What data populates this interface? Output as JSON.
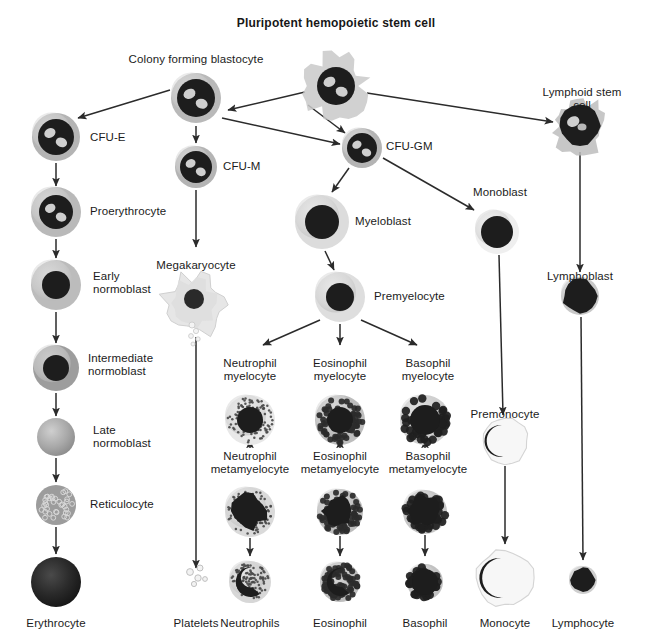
{
  "figure": {
    "title": "Pluripotent hemopoietic stem cell",
    "type": "hematopoiesis-lineage-diagram",
    "background_color": "#ffffff",
    "text_color": "#1b1b1b",
    "arrow_color": "#2b2b2b"
  },
  "cells": [
    {
      "id": "pluripotent-stem-cell",
      "label": "Pluripotent hemopoietic stem cell",
      "label_pos": "top",
      "x": 336,
      "y": 86,
      "r": 27,
      "style": "ragged-blast",
      "cyto": "#c9c9c9",
      "nucleus": "#1d1d1d",
      "nucleus_r": 19,
      "vacuoles": 2
    },
    {
      "id": "colony-forming-blastocyte",
      "label": "Colony forming blastocyte",
      "label_pos": "top",
      "x": 196,
      "y": 98,
      "r": 25,
      "style": "blast",
      "cyto": "#b9b9b9",
      "nucleus": "#1d1d1d",
      "nucleus_r": 19,
      "vacuoles": 2
    },
    {
      "id": "lymphoid-stem-cell",
      "label": "Lymphoid stem cell",
      "label_pos": "top",
      "x": 580,
      "y": 126,
      "r": 24,
      "style": "ragged-dark",
      "cyto": "#bdbdbd",
      "nucleus": "#1d1d1d",
      "nucleus_r": 20,
      "vacuoles": 1
    },
    {
      "id": "cfu-e",
      "label": "CFU-E",
      "label_pos": "right",
      "x": 56,
      "y": 137,
      "r": 24,
      "style": "blast",
      "cyto": "#b4b4b4",
      "nucleus": "#1d1d1d",
      "nucleus_r": 18,
      "vacuoles": 2
    },
    {
      "id": "cfu-m",
      "label": "CFU-M",
      "label_pos": "right",
      "x": 196,
      "y": 167,
      "r": 21,
      "style": "blast",
      "cyto": "#b4b4b4",
      "nucleus": "#1d1d1d",
      "nucleus_r": 16,
      "vacuoles": 2
    },
    {
      "id": "cfu-gm",
      "label": "CFU-GM",
      "label_pos": "right",
      "x": 362,
      "y": 148,
      "r": 20,
      "style": "blast",
      "cyto": "#b4b4b4",
      "nucleus": "#1d1d1d",
      "nucleus_r": 15,
      "vacuoles": 2
    },
    {
      "id": "proerythrocyte",
      "label": "Proerythrocyte",
      "label_pos": "right",
      "x": 56,
      "y": 212,
      "r": 25,
      "style": "blast",
      "cyto": "#b9b9b9",
      "nucleus": "#1d1d1d",
      "nucleus_r": 17,
      "vacuoles": 2
    },
    {
      "id": "myeloblast",
      "label": "Myeloblast",
      "label_pos": "right",
      "x": 322,
      "y": 222,
      "r": 27,
      "style": "pale-blast",
      "cyto": "#dcdcdc",
      "nucleus": "#1d1d1d",
      "nucleus_r": 17,
      "vacuoles": 0
    },
    {
      "id": "monoblast",
      "label": "Monoblast",
      "label_pos": "top",
      "x": 497,
      "y": 232,
      "r": 22,
      "style": "pale-blast",
      "cyto": "#efefef",
      "nucleus": "#1d1d1d",
      "nucleus_r": 16,
      "vacuoles": 0
    },
    {
      "id": "early-normoblast",
      "label": "Early\nnormoblast",
      "label_pos": "right",
      "x": 56,
      "y": 285,
      "r": 25,
      "style": "normoblast",
      "cyto": "#bcbcbc",
      "nucleus": "#1d1d1d",
      "nucleus_r": 14,
      "vacuoles": 0
    },
    {
      "id": "megakaryocyte",
      "label": "Megakaryocyte",
      "label_pos": "top",
      "x": 196,
      "y": 305,
      "r": 30,
      "style": "megakaryocyte",
      "cyto": "#e2e2e2",
      "nucleus": "#2a2a2a",
      "nucleus_r": 10,
      "vacuoles": 0
    },
    {
      "id": "premyelocyte",
      "label": "Premyelocyte",
      "label_pos": "right",
      "x": 340,
      "y": 297,
      "r": 25,
      "style": "pale-blast",
      "cyto": "#dedede",
      "nucleus": "#1d1d1d",
      "nucleus_r": 14,
      "vacuoles": 0
    },
    {
      "id": "lymphoblast",
      "label": "Lymphoblast",
      "label_pos": "top",
      "x": 580,
      "y": 296,
      "r": 19,
      "style": "dark-round",
      "cyto": "#c8c8c8",
      "nucleus": "#1d1d1d",
      "nucleus_r": 17,
      "vacuoles": 0
    },
    {
      "id": "intermediate-normoblast",
      "label": "Intermediate\nnormoblast",
      "label_pos": "right",
      "x": 56,
      "y": 368,
      "r": 23,
      "style": "normoblast",
      "cyto": "#9d9d9d",
      "nucleus": "#1d1d1d",
      "nucleus_r": 13,
      "vacuoles": 0
    },
    {
      "id": "neutrophil-myelocyte",
      "label": "Neutrophil\nmyelocyte",
      "label_pos": "top",
      "x": 250,
      "y": 420,
      "r": 25,
      "style": "granular-fine",
      "cyto": "#e8e8e8",
      "nucleus": "#1d1d1d",
      "nucleus_r": 13,
      "vacuoles": 0
    },
    {
      "id": "eosinophil-myelocyte",
      "label": "Eosinophil\nmyelocyte",
      "label_pos": "top",
      "x": 340,
      "y": 420,
      "r": 25,
      "style": "granular-coarse",
      "cyto": "#bdbdbd",
      "nucleus": "#1d1d1d",
      "nucleus_r": 13,
      "vacuoles": 0
    },
    {
      "id": "basophil-myelocyte",
      "label": "Basophil\nmyelocyte",
      "label_pos": "top",
      "x": 425,
      "y": 420,
      "r": 25,
      "style": "granular-blob",
      "cyto": "#d0d0d0",
      "nucleus": "#1d1d1d",
      "nucleus_r": 15,
      "vacuoles": 0
    },
    {
      "id": "late-normoblast",
      "label": "Late\nnormoblast",
      "label_pos": "right",
      "x": 56,
      "y": 437,
      "r": 19,
      "style": "plain",
      "cyto": "#a9a9a9",
      "nucleus": "#a9a9a9",
      "nucleus_r": 0,
      "vacuoles": 0
    },
    {
      "id": "premonocyte",
      "label": "Premonocyte",
      "label_pos": "top",
      "x": 505,
      "y": 441,
      "r": 23,
      "style": "kidney",
      "cyto": "#f2f2f2",
      "nucleus": "#1d1d1d",
      "nucleus_r": 16,
      "vacuoles": 0
    },
    {
      "id": "neutrophil-metamyelocyte",
      "label": "Neutrophil\nmetamyelocyte",
      "label_pos": "top",
      "x": 250,
      "y": 512,
      "r": 25,
      "style": "granular-fine-band",
      "cyto": "#dadada",
      "nucleus": "#1d1d1d",
      "nucleus_r": 17,
      "vacuoles": 0
    },
    {
      "id": "eosinophil-metamyelocyte",
      "label": "Eosinophil\nmetamyelocyte",
      "label_pos": "top",
      "x": 340,
      "y": 512,
      "r": 23,
      "style": "granular-coarse-band",
      "cyto": "#bdbdbd",
      "nucleus": "#1d1d1d",
      "nucleus_r": 15,
      "vacuoles": 0
    },
    {
      "id": "basophil-metamyelocyte",
      "label": "Basophil\nmetamyelocyte",
      "label_pos": "top",
      "x": 425,
      "y": 512,
      "r": 22,
      "style": "granular-blob-band",
      "cyto": "#c6c6c6",
      "nucleus": "#1d1d1d",
      "nucleus_r": 15,
      "vacuoles": 0
    },
    {
      "id": "reticulocyte",
      "label": "Reticulocyte",
      "label_pos": "right",
      "x": 56,
      "y": 505,
      "r": 20,
      "style": "reticulated",
      "cyto": "#9f9f9f",
      "nucleus": "#9f9f9f",
      "nucleus_r": 0,
      "vacuoles": 0
    },
    {
      "id": "erythrocyte",
      "label": "Erythrocyte",
      "label_pos": "bottom",
      "x": 56,
      "y": 582,
      "r": 25,
      "style": "erythrocyte",
      "cyto": "#262626",
      "nucleus": "#111111",
      "nucleus_r": 18,
      "vacuoles": 0
    },
    {
      "id": "platelets",
      "label": "Platelets",
      "label_pos": "bottom",
      "x": 196,
      "y": 582,
      "r": 9,
      "style": "platelets",
      "cyto": "#e4e4e4",
      "nucleus": "#e4e4e4",
      "nucleus_r": 0,
      "vacuoles": 0
    },
    {
      "id": "neutrophils",
      "label": "Neutrophils",
      "label_pos": "bottom",
      "x": 250,
      "y": 582,
      "r": 21,
      "style": "segmented-fine",
      "cyto": "#d7d7d7",
      "nucleus": "#1d1d1d",
      "nucleus_r": 15,
      "vacuoles": 0
    },
    {
      "id": "eosinophil",
      "label": "Eosinophil",
      "label_pos": "bottom",
      "x": 340,
      "y": 582,
      "r": 20,
      "style": "segmented-coarse",
      "cyto": "#bebebe",
      "nucleus": "#1d1d1d",
      "nucleus_r": 14,
      "vacuoles": 0
    },
    {
      "id": "basophil",
      "label": "Basophil",
      "label_pos": "bottom",
      "x": 425,
      "y": 582,
      "r": 18,
      "style": "granular-blob-dense",
      "cyto": "#c2c2c2",
      "nucleus": "#1d1d1d",
      "nucleus_r": 13,
      "vacuoles": 0
    },
    {
      "id": "monocyte",
      "label": "Monocyte",
      "label_pos": "bottom",
      "x": 505,
      "y": 578,
      "r": 28,
      "style": "kidney-large",
      "cyto": "#f5f5f5",
      "nucleus": "#1d1d1d",
      "nucleus_r": 20,
      "vacuoles": 0
    },
    {
      "id": "lymphocyte",
      "label": "Lymphocyte",
      "label_pos": "bottom",
      "x": 583,
      "y": 580,
      "r": 14,
      "style": "dark-round",
      "cyto": "#cfcfcf",
      "nucleus": "#1d1d1d",
      "nucleus_r": 12,
      "vacuoles": 0
    }
  ],
  "labels": [
    {
      "id": "label-pluripotent",
      "text": "Pluripotent hemopoietic stem cell",
      "x": 336,
      "y": 16,
      "align": "c",
      "bold": true
    },
    {
      "id": "label-colony-forming-blastocyte",
      "text": "Colony forming blastocyte",
      "x": 196,
      "y": 53,
      "align": "c",
      "bold": false
    },
    {
      "id": "label-lymphoid-stem-cell",
      "text": "Lymphoid stem cell",
      "x": 582,
      "y": 86,
      "align": "c",
      "bold": false
    },
    {
      "id": "label-cfu-e",
      "text": "CFU-E",
      "x": 90,
      "y": 131,
      "align": "l",
      "bold": false
    },
    {
      "id": "label-cfu-m",
      "text": "CFU-M",
      "x": 223,
      "y": 160,
      "align": "l",
      "bold": false
    },
    {
      "id": "label-cfu-gm",
      "text": "CFU-GM",
      "x": 386,
      "y": 140,
      "align": "l",
      "bold": false
    },
    {
      "id": "label-proerythrocyte",
      "text": "Proerythrocyte",
      "x": 90,
      "y": 205,
      "align": "l",
      "bold": false
    },
    {
      "id": "label-myeloblast",
      "text": "Myeloblast",
      "x": 355,
      "y": 215,
      "align": "l",
      "bold": false
    },
    {
      "id": "label-monoblast",
      "text": "Monoblast",
      "x": 473,
      "y": 186,
      "align": "l",
      "bold": false
    },
    {
      "id": "label-early-normoblast",
      "text": "Early\nnormoblast",
      "x": 93,
      "y": 270,
      "align": "l",
      "bold": false
    },
    {
      "id": "label-megakaryocyte",
      "text": "Megakaryocyte",
      "x": 196,
      "y": 259,
      "align": "c",
      "bold": false
    },
    {
      "id": "label-premyelocyte",
      "text": "Premyelocyte",
      "x": 374,
      "y": 290,
      "align": "l",
      "bold": false
    },
    {
      "id": "label-lymphoblast",
      "text": "Lymphoblast",
      "x": 580,
      "y": 270,
      "align": "c",
      "bold": false
    },
    {
      "id": "label-intermediate-normoblast",
      "text": "Intermediate\nnormoblast",
      "x": 88,
      "y": 352,
      "align": "l",
      "bold": false
    },
    {
      "id": "label-neutrophil-myelocyte",
      "text": "Neutrophil\nmyelocyte",
      "x": 250,
      "y": 357,
      "align": "c",
      "bold": false
    },
    {
      "id": "label-eosinophil-myelocyte",
      "text": "Eosinophil\nmyelocyte",
      "x": 340,
      "y": 357,
      "align": "c",
      "bold": false
    },
    {
      "id": "label-basophil-myelocyte",
      "text": "Basophil\nmyelocyte",
      "x": 428,
      "y": 357,
      "align": "c",
      "bold": false
    },
    {
      "id": "label-late-normoblast",
      "text": "Late\nnormoblast",
      "x": 93,
      "y": 424,
      "align": "l",
      "bold": false
    },
    {
      "id": "label-premonocyte",
      "text": "Premonocyte",
      "x": 505,
      "y": 408,
      "align": "c",
      "bold": false
    },
    {
      "id": "label-neutrophil-metamyelocyte",
      "text": "Neutrophil\nmetamyelocyte",
      "x": 250,
      "y": 450,
      "align": "c",
      "bold": false
    },
    {
      "id": "label-eosinophil-metamyelocyte",
      "text": "Eosinophil\nmetamyelocyte",
      "x": 340,
      "y": 450,
      "align": "c",
      "bold": false
    },
    {
      "id": "label-basophil-metamyelocyte",
      "text": "Basophil\nmetamyelocyte",
      "x": 428,
      "y": 450,
      "align": "c",
      "bold": false
    },
    {
      "id": "label-reticulocyte",
      "text": "Reticulocyte",
      "x": 90,
      "y": 498,
      "align": "l",
      "bold": false
    },
    {
      "id": "label-erythrocyte",
      "text": "Erythrocyte",
      "x": 56,
      "y": 617,
      "align": "c",
      "bold": false
    },
    {
      "id": "label-platelets",
      "text": "Platelets",
      "x": 196,
      "y": 617,
      "align": "c",
      "bold": false
    },
    {
      "id": "label-neutrophils",
      "text": "Neutrophils",
      "x": 250,
      "y": 617,
      "align": "c",
      "bold": false
    },
    {
      "id": "label-eosinophil",
      "text": "Eosinophil",
      "x": 340,
      "y": 617,
      "align": "c",
      "bold": false
    },
    {
      "id": "label-basophil",
      "text": "Basophil",
      "x": 425,
      "y": 617,
      "align": "c",
      "bold": false
    },
    {
      "id": "label-monocyte",
      "text": "Monocyte",
      "x": 505,
      "y": 617,
      "align": "c",
      "bold": false
    },
    {
      "id": "label-lymphocyte",
      "text": "Lymphocyte",
      "x": 583,
      "y": 617,
      "align": "c",
      "bold": false
    }
  ],
  "arrows": [
    {
      "id": "arrow-stem-to-blastocyte",
      "from": "pluripotent-stem-cell",
      "to": "colony-forming-blastocyte",
      "x1": 305,
      "y1": 92,
      "x2": 228,
      "y2": 110
    },
    {
      "id": "arrow-stem-to-cfu-gm",
      "from": "pluripotent-stem-cell",
      "to": "cfu-gm",
      "x1": 308,
      "y1": 105,
      "x2": 345,
      "y2": 133
    },
    {
      "id": "arrow-stem-to-lymphoid",
      "from": "pluripotent-stem-cell",
      "to": "lymphoid-stem-cell",
      "x1": 367,
      "y1": 93,
      "x2": 553,
      "y2": 122
    },
    {
      "id": "arrow-blastocyte-to-cfu-e",
      "from": "colony-forming-blastocyte",
      "to": "cfu-e",
      "x1": 170,
      "y1": 90,
      "x2": 78,
      "y2": 118
    },
    {
      "id": "arrow-blastocyte-to-cfu-m",
      "from": "colony-forming-blastocyte",
      "to": "cfu-m",
      "x1": 196,
      "y1": 126,
      "x2": 196,
      "y2": 143
    },
    {
      "id": "arrow-blastocyte-to-cfu-gm",
      "from": "colony-forming-blastocyte",
      "to": "cfu-gm",
      "x1": 222,
      "y1": 118,
      "x2": 340,
      "y2": 144
    },
    {
      "id": "arrow-cfu-e-to-proerythrocyte",
      "from": "cfu-e",
      "to": "proerythrocyte",
      "x1": 56,
      "y1": 163,
      "x2": 56,
      "y2": 186
    },
    {
      "id": "arrow-proerythrocyte-to-early",
      "from": "proerythrocyte",
      "to": "early-normoblast",
      "x1": 56,
      "y1": 239,
      "x2": 56,
      "y2": 258
    },
    {
      "id": "arrow-early-to-intermediate",
      "from": "early-normoblast",
      "to": "intermediate-normoblast",
      "x1": 56,
      "y1": 312,
      "x2": 56,
      "y2": 343
    },
    {
      "id": "arrow-intermediate-to-late",
      "from": "intermediate-normoblast",
      "to": "late-normoblast",
      "x1": 56,
      "y1": 393,
      "x2": 56,
      "y2": 416
    },
    {
      "id": "arrow-late-to-reticulocyte",
      "from": "late-normoblast",
      "to": "reticulocyte",
      "x1": 56,
      "y1": 458,
      "x2": 56,
      "y2": 482
    },
    {
      "id": "arrow-reticulocyte-to-erythrocyte",
      "from": "reticulocyte",
      "to": "erythrocyte",
      "x1": 56,
      "y1": 527,
      "x2": 56,
      "y2": 554
    },
    {
      "id": "arrow-cfu-m-to-megakaryocyte",
      "from": "cfu-m",
      "to": "megakaryocyte",
      "x1": 196,
      "y1": 190,
      "x2": 196,
      "y2": 247
    },
    {
      "id": "arrow-megakaryocyte-to-platelets",
      "from": "megakaryocyte",
      "to": "platelets",
      "x1": 196,
      "y1": 337,
      "x2": 196,
      "y2": 568
    },
    {
      "id": "arrow-cfu-gm-to-myeloblast",
      "from": "cfu-gm",
      "to": "myeloblast",
      "x1": 349,
      "y1": 168,
      "x2": 332,
      "y2": 192
    },
    {
      "id": "arrow-cfu-gm-to-monoblast",
      "from": "cfu-gm",
      "to": "monoblast",
      "x1": 383,
      "y1": 158,
      "x2": 474,
      "y2": 210
    },
    {
      "id": "arrow-myeloblast-to-premyelocyte",
      "from": "myeloblast",
      "to": "premyelocyte",
      "x1": 325,
      "y1": 251,
      "x2": 334,
      "y2": 270
    },
    {
      "id": "arrow-premyelocyte-to-neutrophil-m",
      "from": "premyelocyte",
      "to": "neutrophil-myelocyte",
      "x1": 320,
      "y1": 320,
      "x2": 263,
      "y2": 345
    },
    {
      "id": "arrow-premyelocyte-to-eosinophil-m",
      "from": "premyelocyte",
      "to": "eosinophil-myelocyte",
      "x1": 340,
      "y1": 324,
      "x2": 340,
      "y2": 345
    },
    {
      "id": "arrow-premyelocyte-to-basophil-m",
      "from": "premyelocyte",
      "to": "basophil-myelocyte",
      "x1": 361,
      "y1": 320,
      "x2": 417,
      "y2": 345
    },
    {
      "id": "arrow-neutrophil-m-to-meta",
      "from": "neutrophil-myelocyte",
      "to": "neutrophil-metamyelocyte",
      "x1": 250,
      "y1": 448,
      "x2": 250,
      "y2": 440
    },
    {
      "id": "arrow-eosinophil-m-to-meta",
      "from": "eosinophil-myelocyte",
      "to": "eosinophil-metamyelocyte",
      "x1": 340,
      "y1": 448,
      "x2": 340,
      "y2": 440
    },
    {
      "id": "arrow-basophil-m-to-meta",
      "from": "basophil-myelocyte",
      "to": "basophil-metamyelocyte",
      "x1": 425,
      "y1": 448,
      "x2": 425,
      "y2": 440
    },
    {
      "id": "arrow-neutrophil-meta-to-final",
      "from": "neutrophil-metamyelocyte",
      "to": "neutrophils",
      "x1": 250,
      "y1": 538,
      "x2": 250,
      "y2": 556
    },
    {
      "id": "arrow-eosinophil-meta-to-final",
      "from": "eosinophil-metamyelocyte",
      "to": "eosinophil",
      "x1": 340,
      "y1": 536,
      "x2": 340,
      "y2": 556
    },
    {
      "id": "arrow-basophil-meta-to-final",
      "from": "basophil-metamyelocyte",
      "to": "basophil",
      "x1": 425,
      "y1": 535,
      "x2": 425,
      "y2": 556
    },
    {
      "id": "arrow-monoblast-to-premonocyte",
      "from": "monoblast",
      "to": "premonocyte",
      "x1": 499,
      "y1": 255,
      "x2": 503,
      "y2": 415
    },
    {
      "id": "arrow-premonocyte-to-monocyte",
      "from": "premonocyte",
      "to": "monocyte",
      "x1": 505,
      "y1": 466,
      "x2": 505,
      "y2": 544
    },
    {
      "id": "arrow-lymphoid-to-lymphoblast",
      "from": "lymphoid-stem-cell",
      "to": "lymphoblast",
      "x1": 580,
      "y1": 152,
      "x2": 580,
      "y2": 272
    },
    {
      "id": "arrow-lymphoblast-to-lymphocyte",
      "from": "lymphoblast",
      "to": "lymphocyte",
      "x1": 581,
      "y1": 317,
      "x2": 583,
      "y2": 560
    }
  ]
}
